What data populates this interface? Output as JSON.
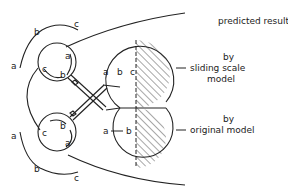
{
  "diagram": {
    "title": "predicted results",
    "models": [
      {
        "prefix": "by",
        "name_line1": "sliding scale",
        "name_line2": "model",
        "bulb_labels": [
          "a",
          "b",
          "c"
        ]
      },
      {
        "prefix": "by",
        "name_line1": "original model",
        "bulb_labels": [
          "a",
          "b"
        ]
      }
    ],
    "upper_small_circle": {
      "inner_labels": [
        "c",
        "b",
        "a"
      ],
      "outer_arc_labels": [
        "a",
        "b",
        "c"
      ]
    },
    "lower_small_circle": {
      "inner_labels": [
        "c",
        "b",
        "a"
      ],
      "outer_arc_labels": [
        "a",
        "b",
        "c"
      ]
    },
    "colors": {
      "line": "#222222",
      "background": "#ffffff"
    }
  }
}
